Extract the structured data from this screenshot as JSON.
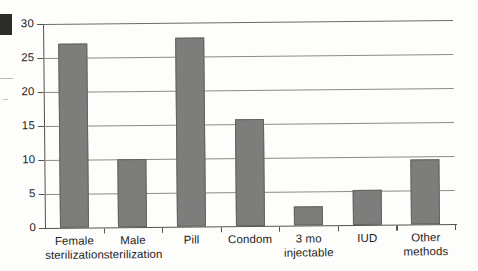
{
  "chart_data": {
    "type": "bar",
    "title": "",
    "subtitle": "",
    "xlabel": "",
    "ylabel": "",
    "categories": [
      "Female sterilization",
      "Male sterilization",
      "Pill",
      "Condom",
      "3 mo injectable",
      "IUD",
      "Other methods"
    ],
    "category_lines": [
      [
        "Female",
        "sterilization"
      ],
      [
        "Male",
        "sterilization"
      ],
      [
        "Pill",
        ""
      ],
      [
        "Condom",
        ""
      ],
      [
        "3 mo",
        "injectable"
      ],
      [
        "IUD",
        ""
      ],
      [
        "Other",
        "methods"
      ]
    ],
    "values": [
      27.0,
      10.0,
      27.8,
      15.8,
      2.8,
      5.1,
      9.6
    ],
    "ylim": [
      0,
      30
    ],
    "ytick_values": [
      0,
      5,
      10,
      15,
      20,
      25,
      30
    ],
    "ytick_labels": [
      "0",
      "5",
      "10",
      "15",
      "20",
      "25",
      "30"
    ],
    "grid": true,
    "grid_axis": "y",
    "legend": false,
    "legend_position": "none",
    "bar_color": "#7d7d7c",
    "bar_edge_color": "#63625f",
    "axis_color": "#55534f",
    "grid_color": "#8d8b87",
    "text_color": "#1e1d1c",
    "background_color": "#fdfdfc"
  },
  "artifacts": {
    "corner_mark": "scan-black-square",
    "edge_marks": [
      "scan-line-upper",
      "scan-line-lower"
    ]
  }
}
